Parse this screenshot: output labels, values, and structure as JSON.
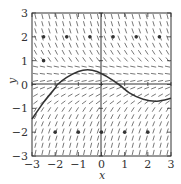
{
  "chart_data": {
    "type": "scatter",
    "subtype": "slope-field",
    "title": "",
    "xlabel": "x",
    "ylabel": "y",
    "xlim": [
      -3,
      3
    ],
    "ylim": [
      -3,
      3
    ],
    "xticks": [
      -3,
      -2,
      -1,
      0,
      1,
      2,
      3
    ],
    "yticks": [
      -3,
      -2,
      -1,
      0,
      1,
      2,
      3
    ],
    "xtick_labels": [
      "−3",
      "−2",
      "−1",
      "0",
      "1",
      "2",
      "3"
    ],
    "ytick_labels": [
      "−3",
      "−2",
      "−1",
      "0",
      "1",
      "2",
      "3"
    ],
    "grid": false,
    "legend": null,
    "points": [
      {
        "x": -2.5,
        "y": 2
      },
      {
        "x": -1.5,
        "y": 2
      },
      {
        "x": -0.5,
        "y": 2
      },
      {
        "x": 0.5,
        "y": 2
      },
      {
        "x": 1.5,
        "y": 2
      },
      {
        "x": 2.5,
        "y": 2
      },
      {
        "x": -2.5,
        "y": 1
      },
      {
        "x": -2,
        "y": -2
      },
      {
        "x": -1,
        "y": -2
      },
      {
        "x": 0,
        "y": -2
      },
      {
        "x": 1,
        "y": -2
      },
      {
        "x": 2,
        "y": -2
      }
    ],
    "solution_curve": {
      "x": [
        -3,
        -2.5,
        -2,
        -1.9,
        -1.5,
        -1,
        -0.6,
        -0.2,
        0.2,
        0.75,
        1.2,
        1.8,
        2.4,
        3
      ],
      "y": [
        -1.45,
        -0.75,
        -0.15,
        0,
        0.3,
        0.55,
        0.62,
        0.55,
        0.35,
        0,
        -0.35,
        -0.62,
        -0.7,
        -0.58
      ]
    },
    "slope_field_description": "Segments steeply negative for y > 1, nearly horizontal for 0 < y < 1, mildly positive for -1 < y < 0, steeply positive for y < -1"
  }
}
